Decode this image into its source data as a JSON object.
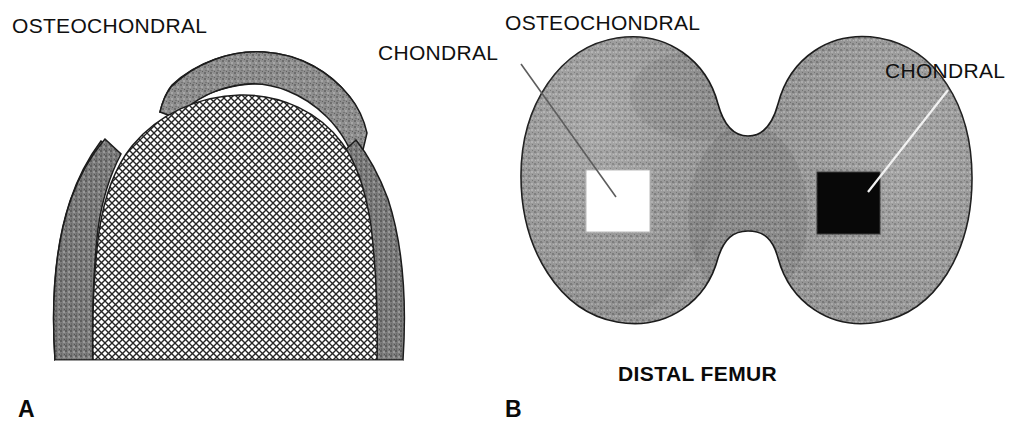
{
  "figure": {
    "background_color": "#ffffff",
    "ink_color": "#101010"
  },
  "panels": [
    {
      "id": "A",
      "letter": "A",
      "view": "sagittal-cross-section",
      "labels": [
        {
          "name": "osteochondral",
          "text": "OSTEOCHONDRAL",
          "x": 12,
          "y": 33,
          "bold": false
        },
        {
          "name": "chondral",
          "text": "CHONDRAL",
          "x": 378,
          "y": 60,
          "bold": false
        }
      ],
      "regions": [
        {
          "name": "osteochondral-bone-shell",
          "fill": "gray-speckle",
          "color": "#8a8a8a"
        },
        {
          "name": "chondral-cartilage-core",
          "fill": "crosshatch",
          "color": "#2b2b2b"
        }
      ]
    },
    {
      "id": "B",
      "letter": "B",
      "view": "distal-femur-axial",
      "caption": "DISTAL FEMUR",
      "caption_x": 618,
      "caption_y": 381,
      "labels": [
        {
          "name": "osteochondral",
          "text": "OSTEOCHONDRAL",
          "x": 505,
          "y": 30,
          "bold": false
        },
        {
          "name": "chondral",
          "text": "CHONDRAL",
          "x": 885,
          "y": 78,
          "bold": false
        }
      ],
      "graft_sites": [
        {
          "name": "osteochondral-graft-site",
          "shape": "square",
          "fill_color": "#ffffff",
          "x": 586,
          "y": 170,
          "width": 64,
          "height": 62,
          "leader_from": [
            521,
            64
          ],
          "leader_to": [
            616,
            197
          ]
        },
        {
          "name": "chondral-graft-site",
          "shape": "square",
          "fill_color": "#080808",
          "x": 817,
          "y": 172,
          "width": 63,
          "height": 62,
          "leader_from": [
            948,
            90
          ],
          "leader_to": [
            868,
            192
          ]
        }
      ],
      "regions": [
        {
          "name": "femoral-condyle-medial",
          "fill": "gray-speckle",
          "color": "#909090"
        },
        {
          "name": "femoral-condyle-lateral",
          "fill": "gray-speckle",
          "color": "#8d8d8d"
        },
        {
          "name": "intercondylar-notch",
          "fill": "none",
          "color": "#ffffff"
        }
      ]
    }
  ],
  "panel_letters": [
    {
      "name": "panel-letter-a",
      "text": "A",
      "x": 18,
      "y": 417
    },
    {
      "name": "panel-letter-b",
      "text": "B",
      "x": 505,
      "y": 417
    }
  ],
  "colors": {
    "bone_gray": "#8a8a8a",
    "bone_gray_dark": "#6e6e6e",
    "cartilage_hatch": "#2b2b2b",
    "outline": "#1c1c1c",
    "white": "#ffffff",
    "black": "#080808",
    "leader_gray": "#5d5d5d"
  }
}
